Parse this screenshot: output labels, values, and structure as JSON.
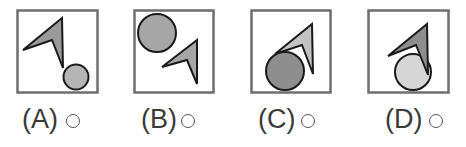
{
  "question": {
    "options": [
      {
        "label": "(A)",
        "radio_selected": false,
        "circle_fill": "#b5b5b5",
        "arrow_fill": "#9a9a9a",
        "arrangement": "arrow upper-left, small circle lower-right"
      },
      {
        "label": "(B)",
        "radio_selected": false,
        "circle_fill": "#a6a6a6",
        "arrow_fill": "#a6a6a6",
        "arrangement": "circle upper-left, arrow lower-right"
      },
      {
        "label": "(C)",
        "radio_selected": false,
        "circle_fill": "#8e8e8e",
        "arrow_fill": "#c2c2c2",
        "arrangement": "arrow on top of circle"
      },
      {
        "label": "(D)",
        "radio_selected": false,
        "circle_fill": "#d6d6d6",
        "arrow_fill": "#8e8e8e",
        "arrangement": "arrow overlapping circle top"
      }
    ]
  },
  "colors": {
    "frame_stroke": "#6e6e6e",
    "shape_stroke": "#1a1a1a",
    "label_text": "#3a3a3a"
  }
}
